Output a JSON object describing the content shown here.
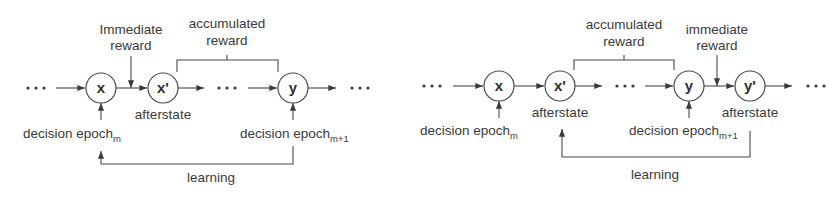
{
  "diagrams": [
    {
      "id": "left",
      "nodes": [
        {
          "label": "x"
        },
        {
          "label": "x'"
        },
        {
          "label": "y"
        }
      ],
      "ellipsis": "• • •",
      "immediate_reward": {
        "line1": "Immediate",
        "line2": "reward"
      },
      "accumulated_reward": {
        "line1": "accumulated",
        "line2": "reward"
      },
      "afterstate_labels": [
        "afterstate"
      ],
      "decision_epoch_m": {
        "text": "decision epoch",
        "sub": "m"
      },
      "decision_epoch_m1": {
        "text": "decision epoch",
        "sub": "m+1"
      },
      "learning": "learning"
    },
    {
      "id": "right",
      "nodes": [
        {
          "label": "x"
        },
        {
          "label": "x'"
        },
        {
          "label": "y"
        },
        {
          "label": "y'"
        }
      ],
      "ellipsis": "• • •",
      "immediate_reward": {
        "line1": "immediate",
        "line2": "reward"
      },
      "accumulated_reward": {
        "line1": "accumulated",
        "line2": "reward"
      },
      "afterstate_labels": [
        "afterstate",
        "afterstate"
      ],
      "decision_epoch_m": {
        "text": "decision epoch",
        "sub": "m"
      },
      "decision_epoch_m1": {
        "text": "decision epoch",
        "sub": "m+1"
      },
      "learning": "learning"
    }
  ],
  "colors": {
    "line": "#4a4a4a",
    "text": "#3a3a3a",
    "background": "#ffffff"
  }
}
